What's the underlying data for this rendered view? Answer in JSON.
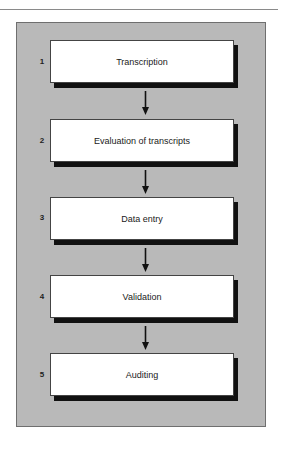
{
  "diagram": {
    "type": "flowchart",
    "orientation": "vertical",
    "colors": {
      "panel_background": "#b9b9b9",
      "box_fill": "#ffffff",
      "box_shadow": "#111111",
      "text": "#1a1a1a",
      "arrow": "#111111"
    },
    "steps": [
      {
        "number": "1",
        "label": "Transcription"
      },
      {
        "number": "2",
        "label": "Evaluation of transcripts"
      },
      {
        "number": "3",
        "label": "Data entry"
      },
      {
        "number": "4",
        "label": "Validation"
      },
      {
        "number": "5",
        "label": "Auditing"
      }
    ],
    "connections": [
      {
        "from": "1",
        "to": "2"
      },
      {
        "from": "2",
        "to": "3"
      },
      {
        "from": "3",
        "to": "4"
      },
      {
        "from": "4",
        "to": "5"
      }
    ]
  }
}
